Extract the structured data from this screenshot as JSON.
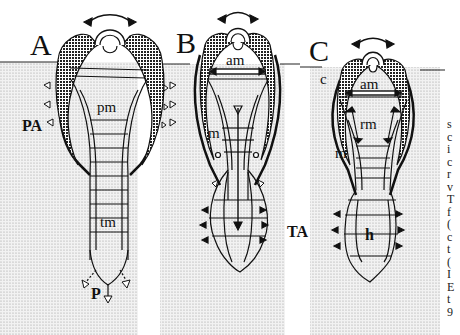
{
  "figure": {
    "panels": [
      {
        "id": "A",
        "label": "A",
        "labels": {
          "side": "PA",
          "muscle": "pm",
          "tail": "tm",
          "bottom": "P"
        }
      },
      {
        "id": "B",
        "label": "B",
        "labels": {
          "top": "am",
          "muscle": "m",
          "side": "TA"
        }
      },
      {
        "id": "C",
        "label": "C",
        "labels": {
          "corner": "c",
          "top": "am",
          "mid": "rm",
          "muscle": "m",
          "bottom": "h"
        }
      }
    ],
    "edge_text": [
      "s",
      "c",
      "i",
      "c",
      "r",
      "v",
      "T",
      "f",
      "(",
      "c",
      "t",
      "(",
      "I",
      "E",
      "t",
      "9"
    ]
  },
  "colors": {
    "ink": "#111111",
    "stipple": "#d9d9d9",
    "paper": "#ffffff"
  }
}
